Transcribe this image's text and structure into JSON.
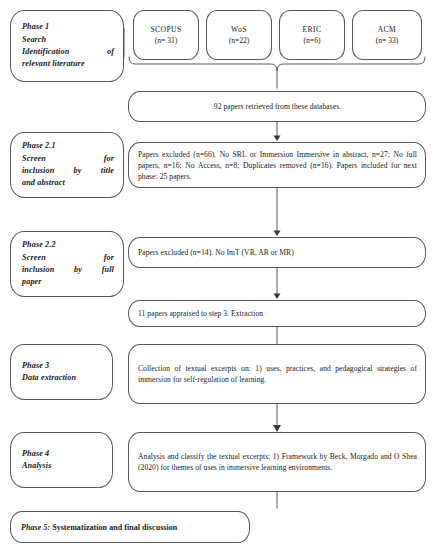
{
  "diagram": {
    "line_color": "#595959",
    "text_color": "#1b1b1b"
  },
  "phases": [
    {
      "id": "phase-1",
      "lines": [
        "Phase 1",
        "Search",
        "Identification of",
        "relevant literature"
      ]
    },
    {
      "id": "phase-2-1",
      "lines": [
        "Phase 2.1",
        "Screen for",
        "inclusion by title",
        "and abstract"
      ]
    },
    {
      "id": "phase-2-2",
      "lines": [
        "Phase 2.2",
        "Screen for",
        "inclusion by full",
        "paper"
      ]
    },
    {
      "id": "phase-3",
      "lines": [
        "Phase 3",
        "Data extraction"
      ]
    },
    {
      "id": "phase-4",
      "lines": [
        "Phase 4",
        "Analysis"
      ]
    }
  ],
  "databases": [
    {
      "name": "SCOPUS",
      "count": "(n= 31)"
    },
    {
      "name": "WoS",
      "count": "(n=22)"
    },
    {
      "name": "ERIC",
      "count": "(n=6)"
    },
    {
      "name": "ACM",
      "count": "(n= 33)"
    }
  ],
  "steps": {
    "retrieved": "92 papers retrieved from these databases.",
    "screen_title_abstract": "Papers excluded (n=66). No SRL or Immersion Immersive in abstract, n=27; No full papers, n=16; No Access, n=8; Duplicates removed (n=16). Papers included for next phase: 25 papers.",
    "screen_full_paper": "Papers excluded (n=14). No ImT (VR, AR or MR)",
    "appraised": "11 papers appraised to step 3. Extraction",
    "data_extraction": "Collection of textual excerpts on: 1) uses, practices, and pedagogical strategies of immersion for self-regulation of learning.",
    "analysis": "Analysis and classify the textual excerpts: 1) Framework by Beck, Morgado and O Shea (2020) for themes of uses in immersive learning environments."
  },
  "final": {
    "lead": "Phase 5:",
    "rest": " Systematization and final discussion"
  }
}
